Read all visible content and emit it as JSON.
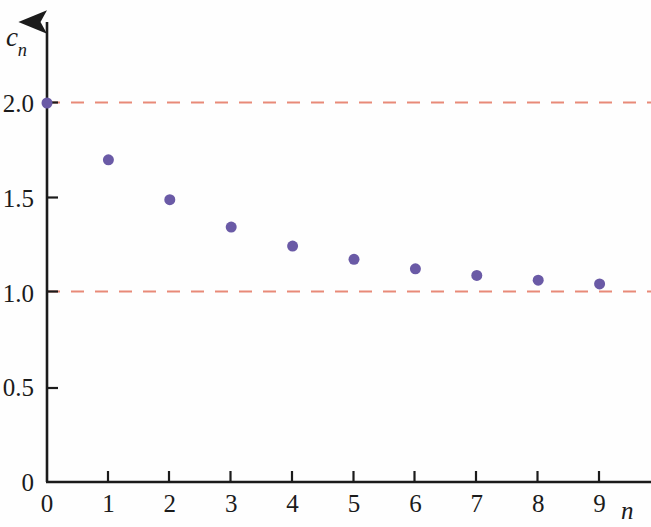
{
  "figure": {
    "background_color": "#fefefe",
    "axis_color": "#1b1b1b",
    "point_color": "#6a5aa6",
    "asymptote_color": "#e88a78"
  },
  "axes": {
    "y_label": "c",
    "y_label_subscript": "n",
    "x_label": "n",
    "y_ticks": [
      "0",
      "0.5",
      "1.0",
      "1.5",
      "2.0"
    ],
    "x_ticks": [
      "0",
      "1",
      "2",
      "3",
      "4",
      "5",
      "6",
      "7",
      "8",
      "9"
    ]
  },
  "chart_data": {
    "type": "scatter",
    "title": "",
    "xlabel": "n",
    "ylabel": "c_n",
    "x": [
      0,
      1,
      2,
      3,
      4,
      5,
      6,
      7,
      8,
      9
    ],
    "values": [
      2.0,
      1.7,
      1.49,
      1.345,
      1.245,
      1.175,
      1.125,
      1.09,
      1.065,
      1.045
    ],
    "series": [
      {
        "name": "c_n",
        "values": [
          2.0,
          1.7,
          1.49,
          1.345,
          1.245,
          1.175,
          1.125,
          1.09,
          1.065,
          1.045
        ]
      }
    ],
    "xlim": [
      0,
      9.8
    ],
    "ylim": [
      0,
      2.15
    ],
    "xticks": [
      0,
      1,
      2,
      3,
      4,
      5,
      6,
      7,
      8,
      9
    ],
    "yticks": [
      0,
      0.5,
      1.0,
      1.5,
      2.0
    ],
    "ytick_labels": [
      "0",
      "0.5",
      "1.0",
      "1.5",
      "2.0"
    ],
    "xtick_labels": [
      "0",
      "1",
      "2",
      "3",
      "4",
      "5",
      "6",
      "7",
      "8",
      "9"
    ],
    "grid": false,
    "legend": null,
    "marker": "circle",
    "marker_color": "#6a5aa6",
    "marker_size": 11,
    "reference_lines": [
      {
        "name": "upper-asymptote",
        "y": 2.0,
        "style": "dashed",
        "color": "#e88a78"
      },
      {
        "name": "lower-asymptote",
        "y": 1.0,
        "style": "dashed",
        "color": "#e88a78"
      }
    ],
    "annotations": []
  }
}
